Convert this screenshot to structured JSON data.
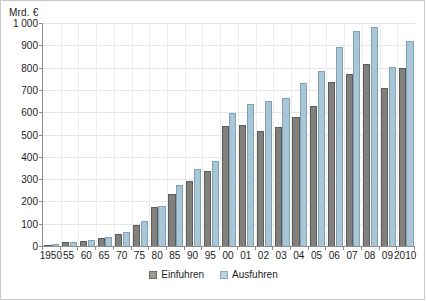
{
  "chart_data": {
    "type": "bar",
    "title": "",
    "subtitle": "",
    "unit_label": "Mrd. €",
    "xlabel": "",
    "ylabel": "Mrd. €",
    "ylim": [
      0,
      1000
    ],
    "ytick_step": 100,
    "yticks": [
      "0",
      "100",
      "200",
      "300",
      "400",
      "500",
      "600",
      "700",
      "800",
      "900",
      "1 000"
    ],
    "grid": true,
    "legend_position": "bottom-center",
    "categories": [
      "1950",
      "55",
      "60",
      "65",
      "70",
      "75",
      "80",
      "85",
      "90",
      "95",
      "00",
      "01",
      "02",
      "03",
      "04",
      "05",
      "06",
      "07",
      "08",
      "09",
      "2010"
    ],
    "series": [
      {
        "name": "Einfuhren",
        "color": "#82807c",
        "values": [
          6,
          16,
          23,
          37,
          55,
          94,
          173,
          235,
          291,
          338,
          538,
          543,
          518,
          535,
          577,
          628,
          734,
          770,
          818,
          708,
          797
        ]
      },
      {
        "name": "Ausfuhren",
        "color": "#a8c6d6",
        "values": [
          8,
          19,
          27,
          41,
          64,
          111,
          178,
          273,
          347,
          381,
          597,
          638,
          651,
          664,
          731,
          786,
          893,
          965,
          984,
          803,
          920
        ]
      }
    ]
  },
  "legend": {
    "items": [
      {
        "label": "Einfuhren",
        "swatch": "series-einfuhren-swatch"
      },
      {
        "label": "Ausfuhren",
        "swatch": "series-ausfuhren-swatch"
      }
    ]
  }
}
